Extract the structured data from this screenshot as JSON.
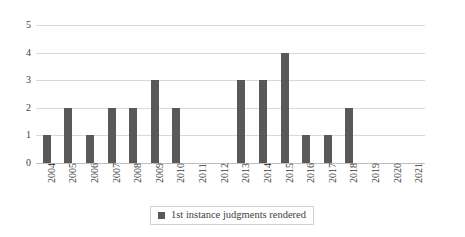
{
  "chart_data": {
    "type": "bar",
    "title": "",
    "subtitle": "",
    "xlabel": "",
    "ylabel": "",
    "categories": [
      "2004",
      "2005",
      "2006",
      "2007",
      "2008",
      "2009",
      "2010",
      "2011",
      "2012",
      "2013",
      "2014",
      "2015",
      "2016",
      "2017",
      "2018",
      "2019",
      "2020",
      "2021"
    ],
    "values": [
      1,
      2,
      1,
      2,
      2,
      3,
      2,
      0,
      0,
      3,
      3,
      4,
      1,
      1,
      2,
      0,
      0,
      0
    ],
    "series": [
      {
        "name": "1st instance judgments rendered",
        "color": "#595959",
        "values": [
          1,
          2,
          1,
          2,
          2,
          3,
          2,
          0,
          0,
          3,
          3,
          4,
          1,
          1,
          2,
          0,
          0,
          0
        ]
      }
    ],
    "ylim": [
      0,
      5
    ],
    "yticks": [
      0,
      1,
      2,
      3,
      4,
      5
    ],
    "ytick_labels": [
      "0",
      "1",
      "2",
      "3",
      "4",
      "5"
    ],
    "grid": true,
    "grid_axis": "y",
    "grid_color": "#d9d9d9",
    "legend": {
      "position": "bottom",
      "bordered": true,
      "entries": [
        {
          "label": "1st instance judgments rendered",
          "swatch": "legend-swatch-icon",
          "color": "#595959"
        }
      ]
    },
    "background": "#ffffff",
    "xlabel_rotation": -90
  }
}
